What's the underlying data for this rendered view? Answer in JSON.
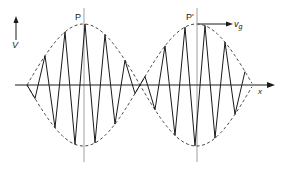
{
  "figure": {
    "type": "wave-packet-diagram",
    "labels": {
      "y_axis": "V",
      "x_axis": "x",
      "peak_1": "P",
      "peak_2": "P'",
      "velocity_main": "v",
      "velocity_sub": "g"
    },
    "colors": {
      "line": "#1a1a1a",
      "envelope": "#333333",
      "marker_line": "#888888",
      "background": "#ffffff"
    },
    "geometry": {
      "axis_y": 85,
      "axis_x_start": 15,
      "axis_x_end": 274,
      "envelope_amplitude": 61,
      "envelope_nodes_x": [
        27,
        140,
        252
      ],
      "peak_x": [
        84,
        197
      ],
      "carrier_period": 20
    }
  }
}
